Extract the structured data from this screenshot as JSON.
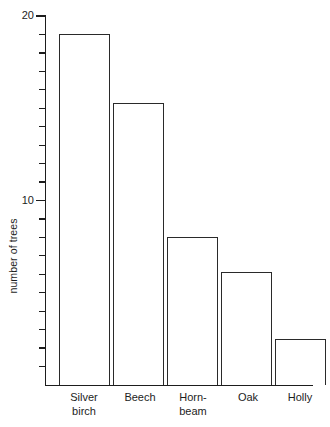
{
  "chart_data": {
    "type": "bar",
    "title": "",
    "xlabel": "",
    "ylabel": "number of trees",
    "categories": [
      "Silver\nbirch",
      "Beech",
      "Horn-\nbeam",
      "Oak",
      "Holly"
    ],
    "category_names": [
      "Silver birch",
      "Beech",
      "Hornbeam",
      "Oak",
      "Holly"
    ],
    "values": [
      19,
      15.3,
      8,
      6.1,
      2.5
    ],
    "ylim": [
      0,
      20
    ],
    "y_major_ticks": [
      10,
      20
    ],
    "y_major_tick_labels": [
      "10",
      "20"
    ],
    "y_minor_tick_step": 1,
    "grid": false,
    "legend": null,
    "bar_style": {
      "fill": "none",
      "outline_color": "#2a2a2a"
    },
    "axis_color": "#1d1d1d"
  },
  "axis": {
    "y_label_text": "number of trees",
    "tick_20": "20",
    "tick_10": "10"
  },
  "bars": [
    {
      "label": "Silver\nbirch",
      "value": 19
    },
    {
      "label": "Beech",
      "value": 15.3
    },
    {
      "label": "Horn-\nbeam",
      "value": 8
    },
    {
      "label": "Oak",
      "value": 6.1
    },
    {
      "label": "Holly",
      "value": 2.5
    }
  ]
}
